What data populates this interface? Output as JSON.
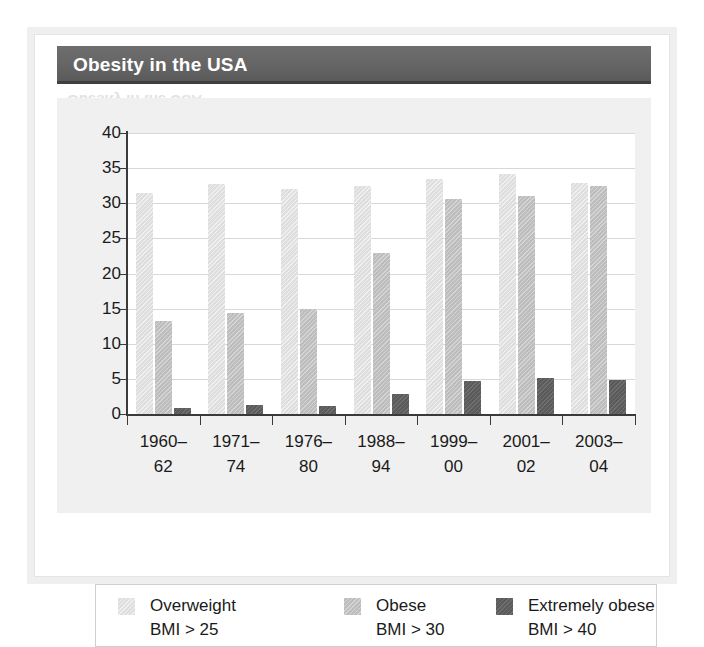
{
  "header": {
    "title": "Obesity in the USA",
    "band_color": "#646464",
    "title_color": "#ffffff",
    "ghost_text": "Obesity in the USA"
  },
  "frame": {
    "border_color": "#efefef",
    "background": "#ffffff",
    "chart_background": "#f0f0f0"
  },
  "chart_data": {
    "type": "bar",
    "title": "Obesity in the USA",
    "xlabel": "",
    "ylabel": "",
    "ylim": [
      0,
      40
    ],
    "yticks": [
      0,
      5,
      10,
      15,
      20,
      25,
      30,
      35,
      40
    ],
    "ytick_labels": [
      "0",
      "5",
      "10",
      "15",
      "20",
      "25",
      "30",
      "35",
      "40"
    ],
    "grid": true,
    "legend_position": "bottom",
    "categories": [
      "1960–62",
      "1971–74",
      "1976–80",
      "1988–94",
      "1999–00",
      "2001–02",
      "2003–04"
    ],
    "category_lines": [
      [
        "1960–",
        "62"
      ],
      [
        "1971–",
        "74"
      ],
      [
        "1976–",
        "80"
      ],
      [
        "1988–",
        "94"
      ],
      [
        "1999–",
        "00"
      ],
      [
        "2001–",
        "02"
      ],
      [
        "2003–",
        "04"
      ]
    ],
    "series": [
      {
        "name": "Overweight",
        "sub": "BMI > 25",
        "color": "#dedede",
        "values": [
          31.5,
          32.7,
          32.0,
          32.5,
          33.4,
          34.1,
          32.9
        ]
      },
      {
        "name": "Obese",
        "sub": "BMI > 30",
        "color": "#bdbdbd",
        "values": [
          13.2,
          14.4,
          14.9,
          22.9,
          30.6,
          31.0,
          32.4
        ]
      },
      {
        "name": "Extremely obese",
        "sub": "BMI > 40",
        "color": "#5b5b5b",
        "values": [
          0.8,
          1.3,
          1.2,
          2.9,
          4.7,
          5.1,
          4.8
        ]
      }
    ]
  },
  "legend": {
    "items": [
      {
        "label": "Overweight",
        "sub": "BMI > 25",
        "swatch": "overweight"
      },
      {
        "label": "Obese",
        "sub": "BMI > 30",
        "swatch": "obese"
      },
      {
        "label": "Extremely obese",
        "sub": "BMI > 40",
        "swatch": "extreme"
      }
    ]
  }
}
